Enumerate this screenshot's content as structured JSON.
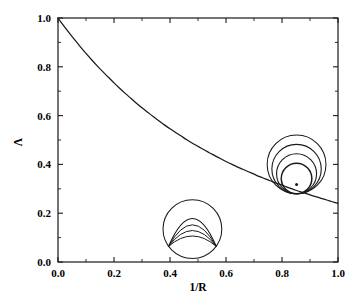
{
  "chart_data": {
    "type": "line",
    "title": "",
    "xlabel": "1/R",
    "ylabel": "Λ",
    "xlim": [
      0.0,
      1.0
    ],
    "ylim": [
      0.0,
      1.0
    ],
    "grid": false,
    "legend": "none",
    "xticks": [
      "0.0",
      "0.2",
      "0.4",
      "0.6",
      "0.8",
      "1.0"
    ],
    "xtick_values": [
      0.0,
      0.2,
      0.4,
      0.6,
      0.8,
      1.0
    ],
    "yticks": [
      "0.0",
      "0.2",
      "0.4",
      "0.6",
      "0.8",
      "1.0"
    ],
    "ytick_values": [
      0.0,
      0.2,
      0.4,
      0.6,
      0.8,
      1.0
    ],
    "series": [
      {
        "name": "Lambda",
        "color": "#1a1a1a",
        "x": [
          0.0,
          0.02,
          0.04,
          0.06,
          0.08,
          0.1,
          0.12,
          0.14,
          0.16,
          0.18,
          0.2,
          0.22,
          0.24,
          0.26,
          0.28,
          0.3,
          0.32,
          0.34,
          0.36,
          0.38,
          0.4,
          0.42,
          0.44,
          0.46,
          0.48,
          0.5,
          0.52,
          0.54,
          0.56,
          0.58,
          0.6,
          0.62,
          0.64,
          0.66,
          0.68,
          0.7,
          0.72,
          0.74,
          0.76,
          0.78,
          0.8,
          0.82,
          0.84,
          0.86,
          0.88,
          0.9,
          0.92,
          0.94,
          0.96,
          0.98,
          1.0
        ],
        "y": [
          1.0,
          0.969,
          0.939,
          0.91,
          0.882,
          0.855,
          0.829,
          0.804,
          0.78,
          0.757,
          0.734,
          0.712,
          0.691,
          0.671,
          0.651,
          0.632,
          0.614,
          0.596,
          0.579,
          0.562,
          0.546,
          0.531,
          0.516,
          0.501,
          0.487,
          0.474,
          0.461,
          0.448,
          0.436,
          0.424,
          0.412,
          0.401,
          0.39,
          0.38,
          0.37,
          0.36,
          0.35,
          0.341,
          0.332,
          0.323,
          0.315,
          0.306,
          0.298,
          0.29,
          0.283,
          0.275,
          0.268,
          0.261,
          0.254,
          0.247,
          0.24
        ],
        "note": "monotonically decreasing convex curve"
      }
    ],
    "annotations": [
      {
        "name": "lower-inset",
        "kind": "circle-with-nested-arcs",
        "center": [
          0.48,
          0.135
        ],
        "radius_data": 0.105,
        "arc_count": 4
      },
      {
        "name": "upper-right-inset",
        "kind": "nested-tangent-circles-with-point",
        "center": [
          0.852,
          0.4
        ],
        "radius_data": 0.105,
        "circle_count": 4,
        "has_center_dot": true
      }
    ]
  },
  "figure": {
    "frame_color": "#1a1a1a",
    "curve_color": "#1a1a1a",
    "background": "#ffffff"
  }
}
